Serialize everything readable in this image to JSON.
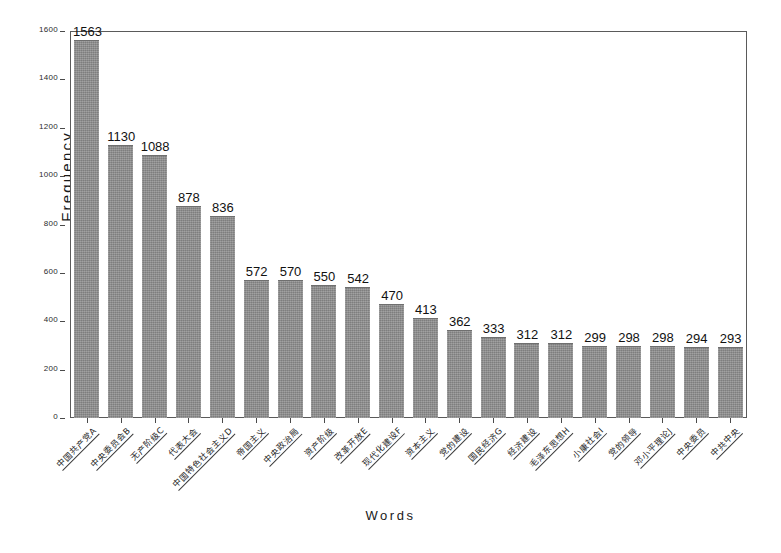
{
  "chart_data": {
    "type": "bar",
    "title": "",
    "xlabel": "Words",
    "ylabel": "Frequency",
    "ylim": [
      0,
      1600
    ],
    "ytick_values": [
      0,
      200,
      400,
      600,
      800,
      1000,
      1200,
      1400,
      1600
    ],
    "ytick_labels": [
      "0",
      "200",
      "400",
      "600",
      "800",
      "1000",
      "1200",
      "1400",
      "1600"
    ],
    "grid": false,
    "legend": "none",
    "bar_color": "#8d8d8d",
    "categories": [
      "中国共产党A",
      "中央委员会B",
      "无产阶级C",
      "代表大会",
      "中国特色社会主义D",
      "帝国主义",
      "中央政治局",
      "资产阶级",
      "改革开放E",
      "现代化建设F",
      "资本主义",
      "党的建设",
      "国民经济G",
      "经济建设",
      "毛泽东思想H",
      "小康社会I",
      "党的领导",
      "邓小平理论J",
      "中央委员",
      "中共中央"
    ],
    "values": [
      1563,
      1130,
      1088,
      878,
      836,
      572,
      570,
      550,
      542,
      470,
      413,
      362,
      333,
      312,
      312,
      299,
      298,
      298,
      294,
      293
    ],
    "value_labels": [
      "1563",
      "1130",
      "1088",
      "878",
      "836",
      "572",
      "570",
      "550",
      "542",
      "470",
      "413",
      "362",
      "333",
      "312",
      "312",
      "299",
      "298",
      "298",
      "294",
      "293"
    ]
  },
  "axis": {
    "y_title": "Frequency",
    "x_title": "Words"
  }
}
